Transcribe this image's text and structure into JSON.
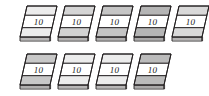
{
  "scene": {
    "title": "money-bundles-illustration",
    "background_color": "#ffffff",
    "item_count": 9,
    "denomination": "10",
    "outline_color": "#231f20",
    "paper_color": "#ffffff",
    "hatch_color": "#8c8c8c"
  },
  "rows": [
    {
      "name": "top-row",
      "count": 5,
      "items": [
        {
          "label": "10",
          "x": 18,
          "top_band": "#ffffff",
          "bottom_band": "#ffffff",
          "edge": "#f2f2f2"
        },
        {
          "label": "10",
          "x": 56,
          "top_band": "#e3e3e3",
          "bottom_band": "#e0e0e0",
          "edge": "#ededed"
        },
        {
          "label": "10",
          "x": 94,
          "top_band": "#d0d0d0",
          "bottom_band": "#cfcfcf",
          "edge": "#e6e6e6"
        },
        {
          "label": "10",
          "x": 132,
          "top_band": "#bdbdbd",
          "bottom_band": "#bcbcbc",
          "edge": "#dedede"
        },
        {
          "label": "10",
          "x": 170,
          "top_band": "#e8e8e8",
          "bottom_band": "#e8e8e8",
          "edge": "#f0f0f0"
        }
      ]
    },
    {
      "name": "bottom-row",
      "count": 4,
      "items": [
        {
          "label": "10",
          "x": 18,
          "top_band": "#d4d4d4",
          "bottom_band": "#d4d4d4",
          "edge": "#e8e8e8"
        },
        {
          "label": "10",
          "x": 56,
          "top_band": "#ffffff",
          "bottom_band": "#ffffff",
          "edge": "#f2f2f2"
        },
        {
          "label": "10",
          "x": 94,
          "top_band": "#ffffff",
          "bottom_band": "#ffffff",
          "edge": "#f2f2f2"
        },
        {
          "label": "10",
          "x": 132,
          "top_band": "#c4c4c4",
          "bottom_band": "#c4c4c4",
          "edge": "#e0e0e0"
        }
      ]
    }
  ]
}
